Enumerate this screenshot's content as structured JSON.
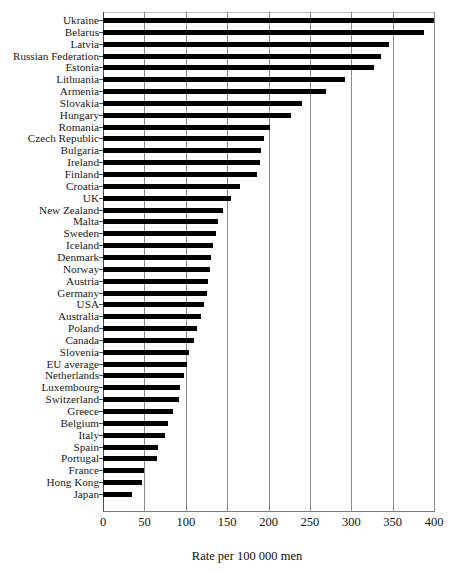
{
  "chart_data": {
    "type": "bar",
    "orientation": "horizontal",
    "title": "",
    "xlabel": "Rate per 100 000 men",
    "ylabel": "",
    "xlim": [
      0,
      400
    ],
    "xticks": [
      0,
      50,
      100,
      150,
      200,
      250,
      300,
      350,
      400
    ],
    "xtick_labels": [
      "0",
      "50",
      "100",
      "150",
      "200",
      "250",
      "300",
      "350",
      "400"
    ],
    "grid": true,
    "grid_axis": "x",
    "legend": false,
    "bar_color": "#000000",
    "categories": [
      "Ukraine",
      "Belarus",
      "Latvia",
      "Russian Federation",
      "Estonia",
      "Lithuania",
      "Armenia",
      "Slovakia",
      "Hungary",
      "Romania",
      "Czech Republic",
      "Bulgaria",
      "Ireland",
      "Finland",
      "Croatia",
      "UK",
      "New Zealand",
      "Malta",
      "Sweden",
      "Iceland",
      "Denmark",
      "Norway",
      "Austria",
      "Germany",
      "USA",
      "Australia",
      "Poland",
      "Canada",
      "Slovenia",
      "EU average",
      "Netherlands",
      "Luxembourg",
      "Switzerland",
      "Greece",
      "Belgium",
      "Italy",
      "Spain",
      "Portugal",
      "France",
      "Hong Kong",
      "Japan"
    ],
    "values": [
      400,
      388,
      346,
      336,
      327,
      293,
      270,
      241,
      227,
      202,
      194,
      191,
      190,
      186,
      166,
      155,
      145,
      139,
      136,
      133,
      131,
      129,
      127,
      126,
      122,
      118,
      114,
      110,
      104,
      101,
      98,
      93,
      92,
      85,
      79,
      75,
      67,
      65,
      49,
      47,
      35
    ]
  }
}
